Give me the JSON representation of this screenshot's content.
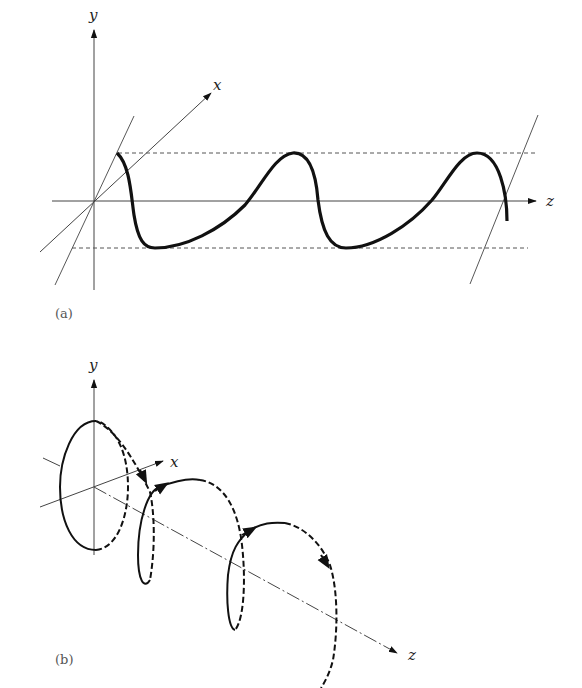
{
  "panel_a": {
    "caption": "(a)",
    "axis_labels": {
      "y": "y",
      "x": "x",
      "z": "z"
    },
    "description": "Linearly polarized wave: sinusoid in a tilted plane along z between dashed amplitude bounds"
  },
  "panel_b": {
    "caption": "(b)",
    "axis_labels": {
      "y": "y",
      "x": "x",
      "z": "z"
    },
    "description": "Circularly polarized wave: helix around z axis with solid front and dashed back segments and direction arrows"
  },
  "colors": {
    "stroke": "#111111",
    "thin": "#444444",
    "background": "#ffffff"
  }
}
